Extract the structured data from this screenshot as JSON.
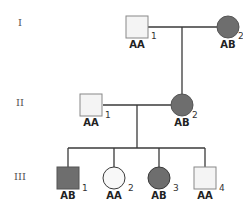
{
  "pedigree": {
    "generations": [
      {
        "label": "I",
        "y": 24
      },
      {
        "label": "II",
        "y": 104
      },
      {
        "label": "III",
        "y": 178
      }
    ],
    "colors": {
      "affected": "#6e6e6e",
      "unaffected": "#f4f4f4",
      "stroke": "#3a3a3a"
    },
    "individuals": [
      {
        "id": "I-1",
        "sex": "male",
        "affected": false,
        "genotype": "AA",
        "number": "1",
        "cx": 137,
        "cy": 27
      },
      {
        "id": "I-2",
        "sex": "female",
        "affected": true,
        "genotype": "AB",
        "number": "2",
        "cx": 228,
        "cy": 27
      },
      {
        "id": "II-1",
        "sex": "male",
        "affected": false,
        "genotype": "AA",
        "number": "1",
        "cx": 91,
        "cy": 105
      },
      {
        "id": "II-2",
        "sex": "female",
        "affected": true,
        "genotype": "AB",
        "number": "2",
        "cx": 182,
        "cy": 105
      },
      {
        "id": "III-1",
        "sex": "male",
        "affected": true,
        "genotype": "AB",
        "number": "1",
        "cx": 68,
        "cy": 178
      },
      {
        "id": "III-2",
        "sex": "female",
        "affected": false,
        "genotype": "AA",
        "number": "2",
        "cx": 114,
        "cy": 178
      },
      {
        "id": "III-3",
        "sex": "female",
        "affected": true,
        "genotype": "AB",
        "number": "3",
        "cx": 159,
        "cy": 178
      },
      {
        "id": "III-4",
        "sex": "male",
        "affected": false,
        "genotype": "AA",
        "number": "4",
        "cx": 205,
        "cy": 178
      }
    ]
  }
}
